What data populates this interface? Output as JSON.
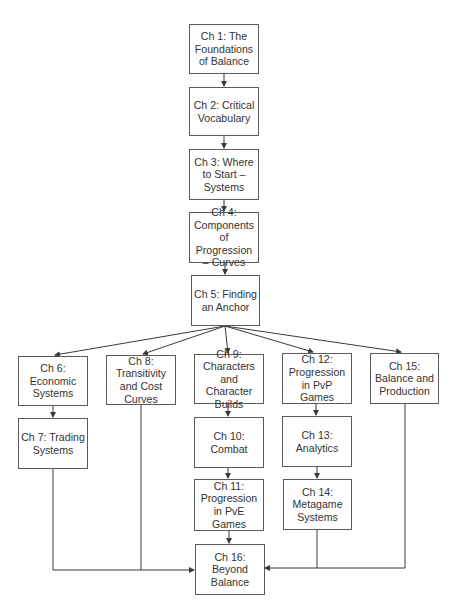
{
  "diagram": {
    "type": "flowchart",
    "colors": {
      "line": "#3a3a3a",
      "border": "#5a5a5a",
      "text": "#333333",
      "background": "#ffffff"
    },
    "nodes": [
      {
        "id": "ch1",
        "label": "Ch 1: The Foundations of Balance"
      },
      {
        "id": "ch2",
        "label": "Ch 2: Critical Vocabulary"
      },
      {
        "id": "ch3",
        "label": "Ch 3: Where to Start – Systems"
      },
      {
        "id": "ch4",
        "label": "Ch 4: Components of Progression – Curves"
      },
      {
        "id": "ch5",
        "label": "Ch 5: Finding an Anchor"
      },
      {
        "id": "ch6",
        "label": "Ch 6: Economic Systems"
      },
      {
        "id": "ch7",
        "label": "Ch 7: Trading Systems"
      },
      {
        "id": "ch8",
        "label": "Ch 8: Transitivity and Cost Curves"
      },
      {
        "id": "ch9",
        "label": "Ch 9: Characters and Character Builds"
      },
      {
        "id": "ch10",
        "label": "Ch 10: Combat"
      },
      {
        "id": "ch11",
        "label": "Ch 11: Progression in PvE Games"
      },
      {
        "id": "ch12",
        "label": "Ch 12: Progression in PvP Games"
      },
      {
        "id": "ch13",
        "label": "Ch 13: Analytics"
      },
      {
        "id": "ch14",
        "label": "Ch 14: Metagame Systems"
      },
      {
        "id": "ch15",
        "label": "Ch 15: Balance and Production"
      },
      {
        "id": "ch16",
        "label": "Ch 16: Beyond Balance"
      }
    ],
    "edges": [
      [
        "ch1",
        "ch2"
      ],
      [
        "ch2",
        "ch3"
      ],
      [
        "ch3",
        "ch4"
      ],
      [
        "ch4",
        "ch5"
      ],
      [
        "ch5",
        "ch6"
      ],
      [
        "ch5",
        "ch8"
      ],
      [
        "ch5",
        "ch9"
      ],
      [
        "ch5",
        "ch12"
      ],
      [
        "ch5",
        "ch15"
      ],
      [
        "ch6",
        "ch7"
      ],
      [
        "ch9",
        "ch10"
      ],
      [
        "ch10",
        "ch11"
      ],
      [
        "ch12",
        "ch13"
      ],
      [
        "ch13",
        "ch14"
      ],
      [
        "ch7",
        "ch16"
      ],
      [
        "ch8",
        "ch16"
      ],
      [
        "ch11",
        "ch16"
      ],
      [
        "ch14",
        "ch16"
      ],
      [
        "ch15",
        "ch16"
      ]
    ]
  }
}
